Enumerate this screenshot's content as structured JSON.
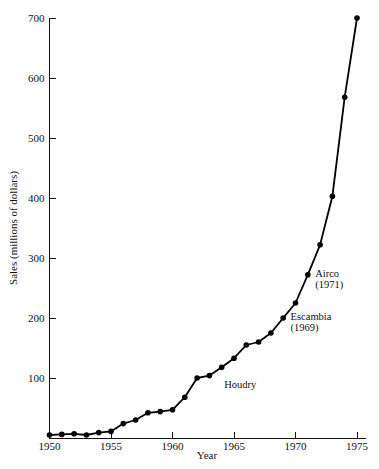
{
  "chart_data": {
    "type": "line",
    "title": "",
    "xlabel": "Year",
    "ylabel": "Sales (millions of dollars)",
    "xlim": [
      1950,
      1975
    ],
    "ylim": [
      0,
      700
    ],
    "grid": false,
    "legend": "none",
    "x_ticks": [
      1950,
      1955,
      1960,
      1965,
      1970,
      1975
    ],
    "x_tick_labels": [
      "1950",
      "1955",
      "1960",
      "1965",
      "1970",
      "1975"
    ],
    "y_ticks": [
      100,
      200,
      300,
      400,
      500,
      600,
      700
    ],
    "y_tick_labels": [
      "100",
      "200",
      "300",
      "400",
      "500",
      "600",
      "700"
    ],
    "series": [
      {
        "name": "Sales",
        "x": [
          1950,
          1951,
          1952,
          1953,
          1954,
          1955,
          1956,
          1957,
          1958,
          1959,
          1960,
          1961,
          1962,
          1963,
          1964,
          1965,
          1966,
          1967,
          1968,
          1969,
          1970,
          1971,
          1972,
          1973,
          1974,
          1975
        ],
        "values": [
          5,
          6,
          7,
          5,
          9,
          11,
          24,
          30,
          42,
          44,
          47,
          68,
          100,
          104,
          118,
          133,
          155,
          160,
          175,
          200,
          225,
          272,
          322,
          403,
          568,
          700
        ]
      }
    ],
    "annotations": [
      {
        "label": "Houdry",
        "line2": "",
        "x": 1964.2,
        "y": 86
      },
      {
        "label": "Escambia",
        "line2": "(1969)",
        "x": 1969.6,
        "y": 200
      },
      {
        "label": "Airco",
        "line2": "(1971)",
        "x": 1971.6,
        "y": 272
      }
    ]
  },
  "caption": {
    "text": ""
  }
}
